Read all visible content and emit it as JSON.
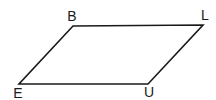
{
  "diagram": {
    "shape": "parallelogram",
    "stroke_color": "#1a1a1a",
    "vertices": [
      {
        "name": "B",
        "x": 73,
        "y": 26,
        "label_x": 72,
        "label_y": 22
      },
      {
        "name": "L",
        "x": 203,
        "y": 25,
        "label_x": 203,
        "label_y": 20
      },
      {
        "name": "U",
        "x": 148,
        "y": 84,
        "label_x": 148,
        "label_y": 97
      },
      {
        "name": "E",
        "x": 19,
        "y": 84,
        "label_x": 18,
        "label_y": 98
      }
    ],
    "labels": {
      "b": "B",
      "l": "L",
      "u": "U",
      "e": "E"
    }
  }
}
